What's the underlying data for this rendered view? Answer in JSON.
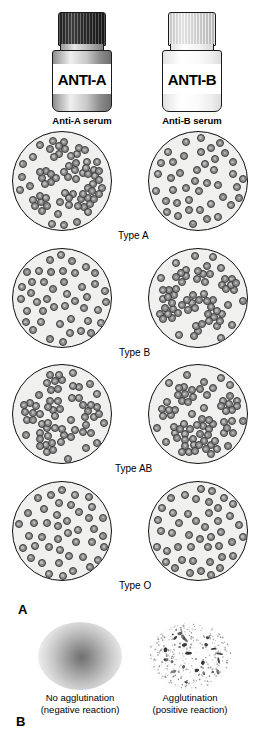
{
  "figure": {
    "panel_a_letter": "A",
    "panel_b_letter": "B"
  },
  "sera": [
    {
      "label": "ANTI-A",
      "caption": "Anti-A serum",
      "cap_color": "#2c2c2c",
      "body_color": "#c9c9c9"
    },
    {
      "label": "ANTI-B",
      "caption": "Anti-B serum",
      "cap_color": "#dcdcdc",
      "body_color": "#fbfbfb"
    }
  ],
  "blood_types": [
    {
      "name": "Type A",
      "anti_a_result": "agglutination",
      "anti_b_result": "no agglutination"
    },
    {
      "name": "Type B",
      "anti_a_result": "no agglutination",
      "anti_b_result": "agglutination"
    },
    {
      "name": "Type AB",
      "anti_a_result": "agglutination",
      "anti_b_result": "agglutination"
    },
    {
      "name": "Type O",
      "anti_a_result": "no agglutination",
      "anti_b_result": "no agglutination"
    }
  ],
  "specimens": [
    {
      "title": "No agglutination",
      "subtitle": "(negative reaction)"
    },
    {
      "title": "Agglutination",
      "subtitle": "(positive reaction)"
    }
  ],
  "colors": {
    "plate_fill": "#f0f0ee",
    "plate_stroke": "#111111",
    "cell_fill": "#8d8d8d",
    "cell_stroke": "#3b3b3b",
    "background": "#ffffff"
  }
}
